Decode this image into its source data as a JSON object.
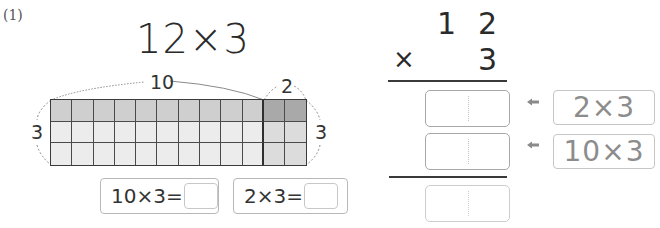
{
  "problem": {
    "number_label": "(1)",
    "title": "12×3"
  },
  "diagram": {
    "top_label_tens": "10",
    "top_label_ones": "2",
    "left_label": "3",
    "right_label": "3",
    "rows": 3,
    "columns": 12,
    "highlighted_columns": 2,
    "colors": {
      "top_row": "#cfcfcf",
      "top_row_highlight": "#a9a9a9",
      "other_rows": "#ececec",
      "other_rows_highlight": "#dcdcdc",
      "grid_line": "#4a4a4a"
    }
  },
  "equations": [
    {
      "expression": "10×3=",
      "answer": ""
    },
    {
      "expression": "2×3=",
      "answer": ""
    }
  ],
  "column_method": {
    "multiplicand_tens": "1",
    "multiplicand_ones": "2",
    "operator": "×",
    "multiplier": "3",
    "partial_rows": [
      {
        "answer": "",
        "hint": "2×3"
      },
      {
        "answer": "",
        "hint": "10×3"
      }
    ],
    "total_answer": ""
  },
  "icons": {
    "hint_arrow": "arrow-left-icon"
  }
}
